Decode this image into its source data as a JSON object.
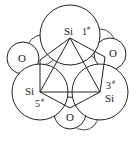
{
  "diagram": {
    "type": "molecular-structure",
    "atoms": [
      {
        "id": "si1",
        "element": "Si",
        "label": "Si",
        "number": "1",
        "superscript": "#",
        "cx": 70,
        "cy": 38,
        "r": 32
      },
      {
        "id": "si3",
        "element": "Si",
        "label": "Si",
        "number": "3",
        "superscript": "#",
        "cx": 100,
        "cy": 92,
        "r": 29
      },
      {
        "id": "si5",
        "element": "Si",
        "label": "Si",
        "number": "5",
        "superscript": "#",
        "cx": 40,
        "cy": 92,
        "r": 29
      },
      {
        "id": "o_left",
        "element": "O",
        "label": "O",
        "cx": 23,
        "cy": 58,
        "r": 16
      },
      {
        "id": "o_right",
        "element": "O",
        "label": "O",
        "cx": 110,
        "cy": 54,
        "r": 16
      },
      {
        "id": "o_bottom",
        "element": "O",
        "label": "O",
        "cx": 70,
        "cy": 112,
        "r": 16
      }
    ],
    "bonds": [
      {
        "from": "si1",
        "to": "si3",
        "kind": "triangle"
      },
      {
        "from": "si3",
        "to": "si5",
        "kind": "triangle"
      },
      {
        "from": "si5",
        "to": "si1",
        "kind": "triangle"
      },
      {
        "from": "si1",
        "to": "o_right",
        "kind": "ring"
      },
      {
        "from": "o_right",
        "to": "si3",
        "kind": "ring"
      },
      {
        "from": "si3",
        "to": "o_bottom",
        "kind": "ring"
      },
      {
        "from": "o_bottom",
        "to": "si5",
        "kind": "ring"
      },
      {
        "from": "si5",
        "to": "o_left",
        "kind": "ring"
      },
      {
        "from": "o_left",
        "to": "si1",
        "kind": "ring"
      }
    ],
    "labels": {
      "si1": "Si",
      "si1_num": "1",
      "si1_sup": "#",
      "si3": "Si",
      "si3_num": "3",
      "si3_sup": "#",
      "si5": "Si",
      "si5_num": "5",
      "si5_sup": "#",
      "o_left": "O",
      "o_right": "O",
      "o_bottom": "O"
    },
    "colors": {
      "stroke": "#222222",
      "fill": "#ffffff",
      "background": "#ffffff"
    }
  }
}
